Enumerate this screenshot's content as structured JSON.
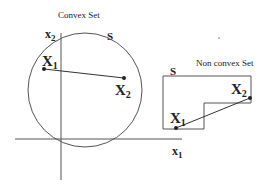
{
  "convex": {
    "title": "Convex Set",
    "set_label": "S",
    "point1": {
      "name": "X",
      "sub": "1"
    },
    "point2": {
      "name": "X",
      "sub": "2"
    }
  },
  "nonconvex": {
    "title": "Non convex Set",
    "set_label": "S",
    "point1": {
      "name": "X",
      "sub": "1"
    },
    "point2": {
      "name": "X",
      "sub": "2"
    }
  },
  "axes": {
    "x_label": {
      "name": "x",
      "sub": "1"
    },
    "y_label": {
      "name": "x",
      "sub": "2"
    }
  },
  "colors": {
    "stroke": "#444444",
    "text": "#222222"
  }
}
